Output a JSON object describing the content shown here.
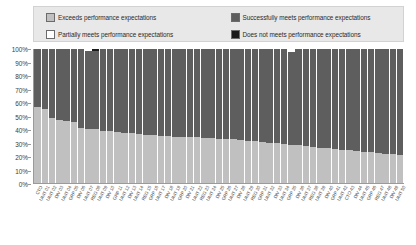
{
  "legend": {
    "items": [
      {
        "label": "Exceeds performance expectations",
        "color": "#c0c0c0",
        "key": "exceeds"
      },
      {
        "label": "Successfully meets performance expectations",
        "color": "#5e5e5e",
        "key": "success"
      },
      {
        "label": "Partially meets performance expectations",
        "color": "#ffffff",
        "key": "partial"
      },
      {
        "label": "Does not meets performance expectations",
        "color": "#1a1a1a",
        "key": "none"
      }
    ]
  },
  "chart_data": {
    "type": "bar",
    "stacked": true,
    "normalized_percent": true,
    "title": "",
    "subtitle": "",
    "xlabel": "",
    "ylabel": "",
    "ylim": [
      0,
      100
    ],
    "ytick_labels": [
      "0%",
      "10%",
      "20%",
      "30%",
      "40%",
      "50%",
      "60%",
      "70%",
      "80%",
      "90%",
      "100%"
    ],
    "ytick_values": [
      0,
      10,
      20,
      30,
      40,
      50,
      60,
      70,
      80,
      90,
      100
    ],
    "grid": false,
    "legend_position": "top",
    "categories": [
      "CTO",
      "UNIT 01",
      "UNIT 02",
      "DIV 03",
      "UNIT 04",
      "GRP 05",
      "DIV 06",
      "UNIT 07",
      "REG 08",
      "UNIT 09",
      "DIV 10",
      "GRP 11",
      "UNIT 12",
      "DIV 13",
      "UNIT 14",
      "REG 15",
      "GRP 16",
      "UNIT 17",
      "DIV 18",
      "UNIT 19",
      "GRP 20",
      "DIV 21",
      "UNIT 22",
      "REG 23",
      "UNIT 24",
      "DIV 25",
      "GRP 26",
      "UNIT 27",
      "DIV 28",
      "UNIT 29",
      "REG 30",
      "GRP 31",
      "UNIT 32",
      "DIV 33",
      "UNIT 34",
      "GRP 35",
      "DIV 36",
      "UNIT 37",
      "REG 38",
      "UNIT 39",
      "DIV 40",
      "GRP 41",
      "UNIT 42",
      "CTO 43",
      "DIV 44",
      "UNIT 45",
      "GRP 46",
      "REG 47",
      "UNIT 48",
      "DIV 49",
      "UNIT 50"
    ],
    "series": [
      {
        "name": "Exceeds performance expectations",
        "color": "#c0c0c0",
        "values": [
          57.0,
          55.5,
          48.5,
          47.0,
          46.5,
          45.5,
          41.0,
          40.5,
          40.0,
          39.0,
          38.5,
          38.0,
          37.5,
          37.0,
          36.5,
          36.0,
          35.5,
          35.0,
          35.0,
          34.5,
          34.5,
          34.0,
          34.0,
          33.5,
          33.5,
          33.0,
          33.0,
          32.5,
          32.0,
          31.5,
          31.0,
          30.5,
          30.0,
          29.5,
          29.0,
          28.5,
          28.0,
          27.5,
          27.0,
          26.5,
          26.0,
          25.5,
          25.0,
          24.5,
          24.0,
          23.5,
          23.0,
          22.5,
          22.0,
          21.5,
          21.0
        ]
      },
      {
        "name": "Successfully meets performance expectations",
        "color": "#5e5e5e",
        "values": [
          43.0,
          44.5,
          51.5,
          53.0,
          53.5,
          54.5,
          59.0,
          58.0,
          58.5,
          61.0,
          61.5,
          62.0,
          62.5,
          63.0,
          63.5,
          64.0,
          64.5,
          65.0,
          65.0,
          65.5,
          65.5,
          66.0,
          66.0,
          66.5,
          66.5,
          67.0,
          67.0,
          67.5,
          68.0,
          68.5,
          69.0,
          69.5,
          70.0,
          70.5,
          71.0,
          69.5,
          72.0,
          72.5,
          73.0,
          73.5,
          74.0,
          74.5,
          75.0,
          75.5,
          76.0,
          76.5,
          77.0,
          77.5,
          78.0,
          78.5,
          79.0
        ]
      },
      {
        "name": "Partially meets performance expectations",
        "color": "#ffffff",
        "values": [
          0,
          0,
          0,
          0,
          0,
          0,
          0,
          1.5,
          0,
          0,
          0,
          0,
          0,
          0,
          0,
          0,
          0,
          0,
          0,
          0,
          0,
          0,
          0,
          0,
          0,
          0,
          0,
          0,
          0,
          0,
          0,
          0,
          0,
          0,
          0,
          2.0,
          0,
          0,
          0,
          0,
          0,
          0,
          0,
          0,
          0,
          0,
          0,
          0,
          0,
          0,
          0
        ]
      },
      {
        "name": "Does not meets performance expectations",
        "color": "#1a1a1a",
        "values": [
          0,
          0,
          0,
          0,
          0,
          0,
          0,
          0,
          1.5,
          0,
          0,
          0,
          0,
          0,
          0,
          0,
          0,
          0,
          0,
          0,
          0,
          0,
          0,
          0,
          0,
          0,
          0,
          0,
          0,
          0,
          0,
          0,
          0,
          0,
          0,
          0,
          0,
          0,
          0,
          0,
          0,
          0,
          0,
          0,
          0,
          0,
          0,
          0,
          0,
          0,
          0
        ]
      }
    ]
  }
}
